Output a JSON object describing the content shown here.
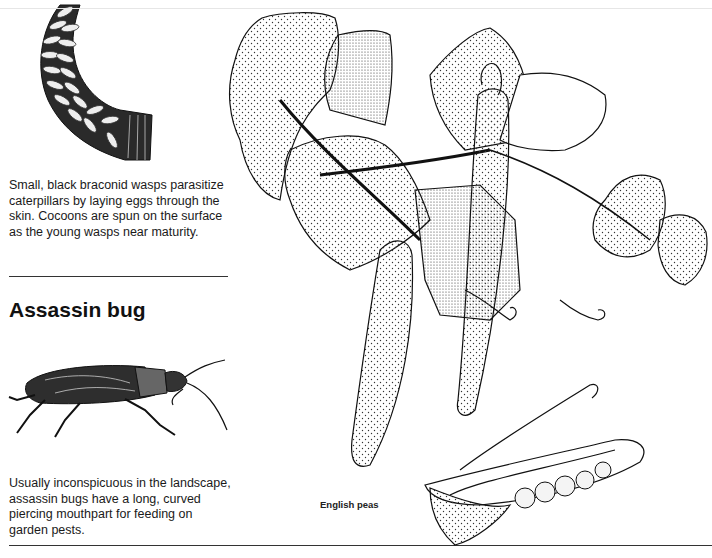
{
  "sections": [
    {
      "name": "braconid-wasps",
      "caption": "Small, black braconid wasps parasitize caterpillars by laying eggs through the skin. Cocoons are spun on the surface as the young wasps near maturity."
    },
    {
      "name": "assassin-bug",
      "heading": "Assassin bug",
      "caption": "Usually inconspicuous in the landscape, assassin bugs have a long, curved piercing mouthpart for feeding on garden pests."
    }
  ],
  "illustrations": {
    "caterpillar": "Caterpillar covered in braconid wasp cocoons",
    "assassin_bug": "Assassin bug",
    "pea_plant": "English pea plant with pods"
  },
  "plant_label": "English peas"
}
